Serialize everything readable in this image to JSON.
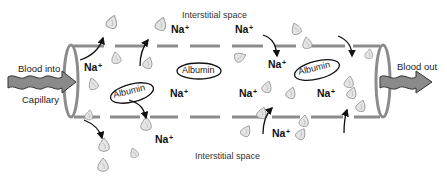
{
  "diagram": {
    "colors": {
      "wall": "#8c8c8c",
      "arrow": "#111111",
      "flow_arrow_fill": "#8a8a8a",
      "flow_arrow_stroke": "#333333",
      "droplet_fill": "#e4e4e4",
      "droplet_stroke": "#9a9a9a",
      "text": "#111111"
    },
    "labels": {
      "interstitial_top": "Interstitial space",
      "interstitial_bottom": "Interstitial space",
      "blood_in": "Blood into",
      "capillary": "Capillary",
      "blood_out": "Blood out",
      "albumin": "Albumin",
      "sodium": "Na",
      "sodium_charge": "+"
    },
    "sodium_ions": [
      {
        "id": "na-left-inside",
        "x": 84,
        "y": 65
      },
      {
        "id": "na-top-left",
        "x": 171,
        "y": 27
      },
      {
        "id": "na-top-right",
        "x": 235,
        "y": 27
      },
      {
        "id": "na-inside-right-upper",
        "x": 267,
        "y": 61
      },
      {
        "id": "na-inside-center-left",
        "x": 170,
        "y": 89
      },
      {
        "id": "na-inside-center",
        "x": 239,
        "y": 89
      },
      {
        "id": "na-inside-right-lower",
        "x": 317,
        "y": 89
      },
      {
        "id": "na-bottom-left",
        "x": 155,
        "y": 137
      },
      {
        "id": "na-bottom-right",
        "x": 272,
        "y": 131
      }
    ],
    "albumin": [
      {
        "id": "albumin-left",
        "cx": 132,
        "cy": 93,
        "rx": 22,
        "ry": 9,
        "rot": -14
      },
      {
        "id": "albumin-center",
        "cx": 199,
        "cy": 71,
        "rx": 22,
        "ry": 8,
        "rot": 0
      },
      {
        "id": "albumin-right",
        "cx": 317,
        "cy": 70,
        "rx": 23,
        "ry": 9,
        "rot": -14
      }
    ],
    "droplets": [
      {
        "x": 112,
        "y": 22,
        "s": 1,
        "r": 20
      },
      {
        "x": 161,
        "y": 24,
        "s": 1,
        "r": 20
      },
      {
        "x": 116,
        "y": 58,
        "s": 0.9,
        "r": -10
      },
      {
        "x": 148,
        "y": 63,
        "s": 0.9,
        "r": 20
      },
      {
        "x": 93,
        "y": 84,
        "s": 0.9,
        "r": -20
      },
      {
        "x": 89,
        "y": 115,
        "s": 0.8,
        "r": 10
      },
      {
        "x": 240,
        "y": 57,
        "s": 0.9,
        "r": 70
      },
      {
        "x": 267,
        "y": 87,
        "s": 0.9,
        "r": 20
      },
      {
        "x": 262,
        "y": 113,
        "s": 0.9,
        "r": 20
      },
      {
        "x": 246,
        "y": 131,
        "s": 0.9,
        "r": 30
      },
      {
        "x": 296,
        "y": 29,
        "s": 0.9,
        "r": -20
      },
      {
        "x": 307,
        "y": 43,
        "s": 0.9,
        "r": -10
      },
      {
        "x": 304,
        "y": 121,
        "s": 0.9,
        "r": 10
      },
      {
        "x": 291,
        "y": 93,
        "s": 0.9,
        "r": 20
      },
      {
        "x": 301,
        "y": 134,
        "s": 0.9,
        "r": 30
      },
      {
        "x": 352,
        "y": 93,
        "s": 0.9,
        "r": 20
      },
      {
        "x": 361,
        "y": 106,
        "s": 0.9,
        "r": 20
      },
      {
        "x": 349,
        "y": 82,
        "s": 0.9,
        "r": 10
      },
      {
        "x": 369,
        "y": 54,
        "s": 0.8,
        "r": 10
      },
      {
        "x": 104,
        "y": 145,
        "s": 1,
        "r": 0
      },
      {
        "x": 103,
        "y": 165,
        "s": 1,
        "r": 0
      },
      {
        "x": 134,
        "y": 153,
        "s": 0.8,
        "r": -20
      },
      {
        "x": 146,
        "y": 124,
        "s": 1,
        "r": 0
      }
    ]
  }
}
